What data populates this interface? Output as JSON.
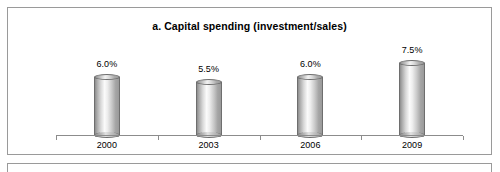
{
  "chart_data": {
    "type": "bar",
    "title": "a. Capital spending (investment/sales)",
    "xlabel": "",
    "ylabel": "",
    "categories": [
      "2000",
      "2003",
      "2006",
      "2009"
    ],
    "values": [
      6.0,
      5.5,
      6.0,
      7.5
    ],
    "value_labels": [
      "6.0%",
      "5.5%",
      "6.0%",
      "7.5%"
    ],
    "ylim": [
      0,
      8.5
    ],
    "grid": false,
    "legend": null,
    "series": [
      {
        "name": "Capital spending (investment/sales)",
        "values": [
          6.0,
          5.5,
          6.0,
          7.5
        ]
      }
    ],
    "axis": {
      "show_x_axis_line": true,
      "show_y_axis_line": false,
      "tick_marks": true
    },
    "style": {
      "bar_shape": "cylinder",
      "bar_fill": "gray-gradient",
      "bar_edge_color": "#6e6e6e",
      "axis_color": "#8c8c8c",
      "text_color": "#000000",
      "panel_border_color": "#9a9a9a",
      "background": "#ffffff"
    }
  },
  "panels": {
    "chart_panel_name": "capital-spending-chart",
    "next_panel_name": "adjacent-panel-top-edge"
  }
}
